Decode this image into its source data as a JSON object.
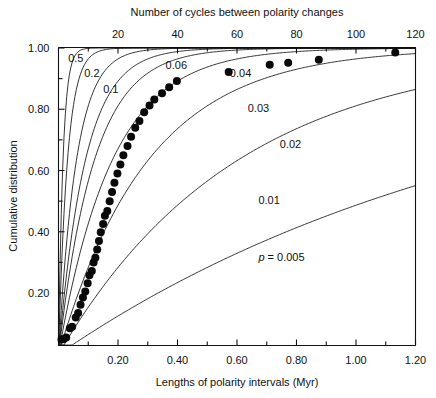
{
  "chart_data": {
    "type": "line",
    "title": "",
    "top_axis": {
      "label": "Number of cycles between polarity changes",
      "ticks": [
        20,
        40,
        60,
        80,
        100,
        120
      ],
      "tick_labels": [
        "20",
        "40",
        "60",
        "80",
        "100",
        "120"
      ],
      "range": [
        0,
        120
      ]
    },
    "xlabel": "Lengths of polarity intervals (Myr)",
    "x_tick_labels": [
      "0.20",
      "0.40",
      "0.60",
      "0.80",
      "1.00",
      "1.20"
    ],
    "x_ticks": [
      0.2,
      0.4,
      0.6,
      0.8,
      1.0,
      1.2
    ],
    "x_minor_ticks": [
      0.1,
      0.3,
      0.5,
      0.7,
      0.9,
      1.1
    ],
    "xlim": [
      0,
      1.2
    ],
    "ylabel": "Cumulative distribution",
    "y_tick_labels": [
      "0.20",
      "0.40",
      "0.60",
      "0.80",
      "1.00"
    ],
    "y_ticks": [
      0.2,
      0.4,
      0.6,
      0.8,
      1.0
    ],
    "y_minor_ticks": [
      0.1,
      0.3,
      0.5,
      0.7,
      0.9
    ],
    "ylim": [
      0.03,
      1.0
    ],
    "grid": false,
    "legend_position": "inline-curve-labels",
    "curve_param_symbol": "p",
    "curves": [
      {
        "name": "p = 0.5",
        "label": "0.5",
        "p": 0.5,
        "label_x": 0.027,
        "label_y": 0.955,
        "style": "solid"
      },
      {
        "name": "p = 0.2",
        "label": "0.2",
        "p": 0.2,
        "label_x": 0.072,
        "label_y": 0.905,
        "style": "solid"
      },
      {
        "name": "p = 0.1",
        "label": "0.1",
        "p": 0.1,
        "label_x": 0.125,
        "label_y": 0.853,
        "style": "solid"
      },
      {
        "name": "p = 0.06",
        "label": "0.06",
        "p": 0.06,
        "label_x": 0.3,
        "label_y": 0.93,
        "style": "solid"
      },
      {
        "name": "p = 0.04",
        "label": "0.04",
        "p": 0.04,
        "label_x": 0.48,
        "label_y": 0.905,
        "style": "solid"
      },
      {
        "name": "p = 0.03",
        "label": "0.03",
        "p": 0.03,
        "label_x": 0.53,
        "label_y": 0.79,
        "style": "solid"
      },
      {
        "name": "p = 0.02",
        "label": "0.02",
        "p": 0.02,
        "label_x": 0.62,
        "label_y": 0.672,
        "style": "solid"
      },
      {
        "name": "p = 0.01",
        "label": "0.01",
        "p": 0.01,
        "label_x": 0.56,
        "label_y": 0.49,
        "style": "solid"
      },
      {
        "name": "p = 0.005",
        "label": "p = 0.005",
        "p": 0.005,
        "label_x": 0.56,
        "label_y": 0.305,
        "style": "solid"
      }
    ],
    "series": [
      {
        "name": "observed cumulative distribution",
        "marker": "filled-circle",
        "points": [
          [
            0.01,
            0.048
          ],
          [
            0.018,
            0.05
          ],
          [
            0.026,
            0.055
          ],
          [
            0.038,
            0.085
          ],
          [
            0.046,
            0.09
          ],
          [
            0.058,
            0.12
          ],
          [
            0.066,
            0.135
          ],
          [
            0.074,
            0.162
          ],
          [
            0.082,
            0.185
          ],
          [
            0.09,
            0.205
          ],
          [
            0.098,
            0.232
          ],
          [
            0.104,
            0.258
          ],
          [
            0.112,
            0.272
          ],
          [
            0.118,
            0.3
          ],
          [
            0.124,
            0.315
          ],
          [
            0.13,
            0.342
          ],
          [
            0.136,
            0.37
          ],
          [
            0.142,
            0.398
          ],
          [
            0.15,
            0.425
          ],
          [
            0.156,
            0.452
          ],
          [
            0.164,
            0.468
          ],
          [
            0.172,
            0.5
          ],
          [
            0.18,
            0.53
          ],
          [
            0.188,
            0.56
          ],
          [
            0.198,
            0.59
          ],
          [
            0.208,
            0.62
          ],
          [
            0.218,
            0.65
          ],
          [
            0.232,
            0.68
          ],
          [
            0.244,
            0.71
          ],
          [
            0.258,
            0.74
          ],
          [
            0.272,
            0.762
          ],
          [
            0.288,
            0.79
          ],
          [
            0.306,
            0.812
          ],
          [
            0.322,
            0.832
          ],
          [
            0.348,
            0.852
          ],
          [
            0.372,
            0.872
          ],
          [
            0.398,
            0.892
          ],
          [
            0.572,
            0.922
          ],
          [
            0.71,
            0.945
          ],
          [
            0.772,
            0.952
          ],
          [
            0.875,
            0.962
          ],
          [
            1.132,
            0.985
          ]
        ]
      }
    ]
  }
}
